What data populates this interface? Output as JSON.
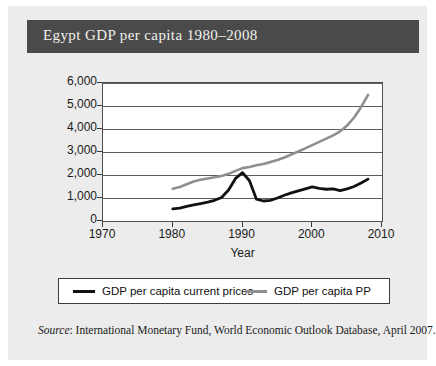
{
  "title": "Egypt GDP per capita 1980–2008",
  "axis": {
    "x_title": "Year",
    "y_ticks": [
      "6,000",
      "5,000",
      "4,000",
      "3,000",
      "2,000",
      "1,000",
      "0"
    ],
    "x_ticks": [
      "1970",
      "1980",
      "1990",
      "2000",
      "2010"
    ]
  },
  "legend": {
    "items": [
      {
        "label": "GDP per capita current prices",
        "color": "#111111"
      },
      {
        "label": "GDP per capita PP",
        "color": "#8f8f8f"
      }
    ]
  },
  "source": {
    "prefix": "Source",
    "text": ": International Monetary Fund, World Economic Outlook Database, April 2007."
  },
  "colors": {
    "banner": "#4a4a4a",
    "page": "#ececec",
    "plot_background": "#ffffff",
    "gridline": "#5c5c5c",
    "series_current_prices": "#111111",
    "series_ppp": "#8f8f8f"
  },
  "chart_data": {
    "type": "line",
    "title": "Egypt GDP per capita 1980–2008",
    "xlabel": "Year",
    "ylabel": "",
    "xlim": [
      1970,
      2010
    ],
    "ylim": [
      0,
      6000
    ],
    "xticks": [
      1970,
      1980,
      1990,
      2000,
      2010
    ],
    "yticks": [
      0,
      1000,
      2000,
      3000,
      4000,
      5000,
      6000
    ],
    "grid": true,
    "legend_position": "below-plot",
    "x": [
      1980,
      1981,
      1982,
      1983,
      1984,
      1985,
      1986,
      1987,
      1988,
      1989,
      1990,
      1991,
      1992,
      1993,
      1994,
      1995,
      1996,
      1997,
      1998,
      1999,
      2000,
      2001,
      2002,
      2003,
      2004,
      2005,
      2006,
      2007,
      2008
    ],
    "series": [
      {
        "name": "GDP per capita current prices",
        "color": "#111111",
        "values": [
          530,
          560,
          640,
          700,
          760,
          820,
          900,
          1020,
          1350,
          1850,
          2100,
          1750,
          950,
          870,
          900,
          1000,
          1120,
          1220,
          1310,
          1400,
          1480,
          1420,
          1380,
          1400,
          1320,
          1400,
          1500,
          1650,
          1820
        ]
      },
      {
        "name": "GDP per capita PP",
        "color": "#8f8f8f",
        "values": [
          1400,
          1480,
          1600,
          1720,
          1790,
          1850,
          1900,
          1960,
          2050,
          2180,
          2300,
          2350,
          2420,
          2480,
          2560,
          2650,
          2760,
          2890,
          3020,
          3160,
          3300,
          3440,
          3580,
          3720,
          3900,
          4150,
          4500,
          4950,
          5480
        ]
      }
    ]
  }
}
